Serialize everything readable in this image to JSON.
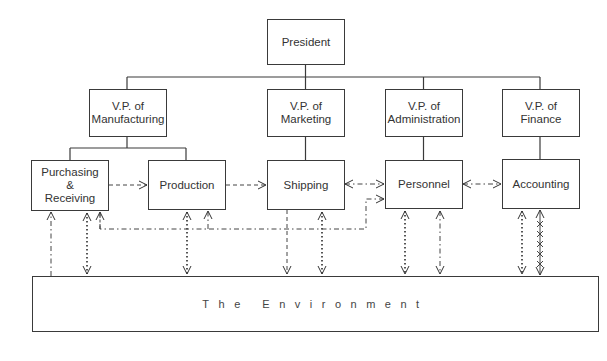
{
  "diagram": {
    "type": "organization-chart",
    "nodes": {
      "president": "President",
      "vp_manufacturing": "V.P. of\nManufacturing",
      "vp_marketing": "V.P. of\nMarketing",
      "vp_administration": "V.P. of\nAdministration",
      "vp_finance": "V.P. of\nFinance",
      "purchasing": "Purchasing\n&\nReceiving",
      "production": "Production",
      "shipping": "Shipping",
      "personnel": "Personnel",
      "accounting": "Accounting",
      "environment": "The Environment"
    },
    "hierarchy": [
      {
        "from": "President",
        "to": "V.P. of Manufacturing"
      },
      {
        "from": "President",
        "to": "V.P. of Marketing"
      },
      {
        "from": "President",
        "to": "V.P. of Administration"
      },
      {
        "from": "President",
        "to": "V.P. of Finance"
      },
      {
        "from": "V.P. of Manufacturing",
        "to": "Purchasing & Receiving"
      },
      {
        "from": "V.P. of Manufacturing",
        "to": "Production"
      },
      {
        "from": "V.P. of Marketing",
        "to": "Shipping"
      },
      {
        "from": "V.P. of Administration",
        "to": "Personnel"
      },
      {
        "from": "V.P. of Finance",
        "to": "Accounting"
      }
    ],
    "flows": [
      {
        "from": "Purchasing & Receiving",
        "to": "Production",
        "style": "dashed",
        "direction": "one-way"
      },
      {
        "from": "Production",
        "to": "Shipping",
        "style": "dashed",
        "direction": "one-way"
      },
      {
        "from": "Shipping",
        "to": "Personnel",
        "style": "dash-dot",
        "direction": "two-way"
      },
      {
        "from": "Personnel",
        "to": "Accounting",
        "style": "dash-dot",
        "direction": "two-way"
      },
      {
        "from": "The Environment",
        "to": "Purchasing & Receiving",
        "style": "dash-dot",
        "direction": "one-way"
      },
      {
        "from": "Purchasing & Receiving",
        "to": "The Environment",
        "style": "dotted",
        "direction": "two-way"
      },
      {
        "from": "Production",
        "to": "The Environment",
        "style": "dotted",
        "direction": "two-way"
      },
      {
        "from": "Shipping",
        "to": "The Environment",
        "style": "dashed",
        "direction": "one-way"
      },
      {
        "from": "Shipping",
        "to": "The Environment",
        "style": "dotted",
        "direction": "two-way"
      },
      {
        "from": "Personnel",
        "to": "The Environment",
        "style": "dotted",
        "direction": "two-way"
      },
      {
        "from": "Personnel",
        "to": "The Environment",
        "style": "dash-dot",
        "direction": "two-way"
      },
      {
        "from": "Accounting",
        "to": "The Environment",
        "style": "dotted",
        "direction": "two-way"
      },
      {
        "from": "Accounting",
        "to": "The Environment",
        "style": "cross-marked",
        "direction": "two-way"
      },
      {
        "from": "Personnel",
        "to": "Purchasing & Receiving / Production",
        "style": "dash-dot",
        "direction": "branching"
      }
    ]
  }
}
